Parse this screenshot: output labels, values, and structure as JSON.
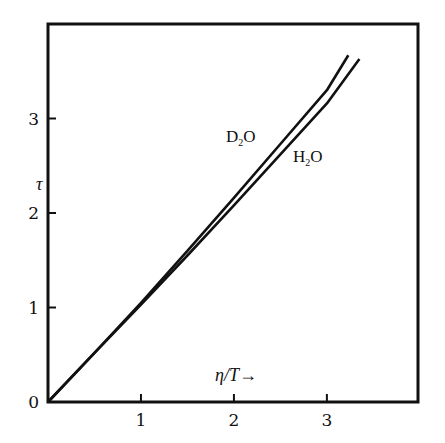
{
  "chart_data": {
    "type": "line",
    "title": "",
    "xlabel": "η/T→",
    "ylabel": "τ",
    "xlim": [
      0,
      3.98
    ],
    "ylim": [
      0,
      4.0
    ],
    "x_ticks": [
      0,
      1,
      2,
      3
    ],
    "x_tick_labels": [
      "",
      "1",
      "2",
      "3"
    ],
    "y_ticks": [
      0,
      1,
      2,
      3
    ],
    "y_tick_labels": [
      "0",
      "1",
      "2",
      "3"
    ],
    "grid": false,
    "legend": "inline labels next to curves",
    "series": [
      {
        "name": "D₂O",
        "label_main": "D",
        "label_sub": "2",
        "label_tail": "O",
        "x": [
          0,
          0.5,
          1.0,
          1.5,
          2.0,
          2.5,
          3.0,
          3.23
        ],
        "y": [
          0,
          0.52,
          1.05,
          1.6,
          2.16,
          2.73,
          3.3,
          3.67
        ]
      },
      {
        "name": "H₂O",
        "label_main": "H",
        "label_sub": "2",
        "label_tail": "O",
        "x": [
          0,
          0.5,
          1.0,
          1.5,
          2.0,
          2.5,
          3.0,
          3.35
        ],
        "y": [
          0,
          0.52,
          1.03,
          1.55,
          2.08,
          2.62,
          3.16,
          3.63
        ]
      }
    ]
  },
  "plot": {
    "frame_color": "#111111",
    "line_color": "#111111",
    "background": "#ffffff"
  }
}
